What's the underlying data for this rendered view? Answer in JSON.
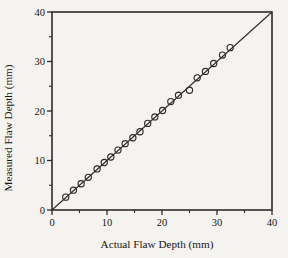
{
  "chart_data": {
    "type": "scatter",
    "title": "",
    "xlabel": "Actual Flaw Depth (mm)",
    "ylabel": "Measured Flaw Depth (mm)",
    "xlim": [
      0,
      40
    ],
    "ylim": [
      0,
      40
    ],
    "x_major_ticks": [
      0,
      10,
      20,
      30,
      40
    ],
    "x_minor_ticks": [
      5,
      15,
      25,
      35
    ],
    "y_major_ticks": [
      0,
      10,
      20,
      30,
      40
    ],
    "y_minor_ticks": [
      5,
      15,
      25,
      35
    ],
    "grid": false,
    "legend": "none",
    "frame": "full-box",
    "series": [
      {
        "name": "flaw-depth-measurements",
        "marker": "open-circle",
        "points": [
          [
            2.5,
            2.6
          ],
          [
            3.9,
            4.0
          ],
          [
            5.3,
            5.3
          ],
          [
            6.6,
            6.6
          ],
          [
            8.2,
            8.3
          ],
          [
            9.5,
            9.6
          ],
          [
            10.7,
            10.7
          ],
          [
            12.0,
            12.1
          ],
          [
            13.3,
            13.4
          ],
          [
            14.7,
            14.6
          ],
          [
            16.0,
            15.8
          ],
          [
            17.4,
            17.5
          ],
          [
            18.7,
            18.8
          ],
          [
            20.1,
            20.1
          ],
          [
            21.6,
            21.9
          ],
          [
            23.0,
            23.2
          ],
          [
            25.0,
            24.2
          ],
          [
            26.4,
            26.7
          ],
          [
            27.9,
            28.0
          ],
          [
            29.4,
            29.6
          ],
          [
            31.0,
            31.3
          ],
          [
            32.4,
            32.8
          ]
        ]
      }
    ],
    "reference_line": {
      "from": [
        0,
        0
      ],
      "to": [
        40,
        40
      ],
      "description": "45-degree line, measured = actual"
    }
  },
  "colors": {
    "background": "#f5f3ef",
    "ink": "#2e2b28",
    "text": "#181512"
  }
}
